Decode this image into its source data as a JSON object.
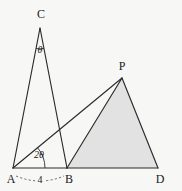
{
  "figure": {
    "type": "geometry-diagram",
    "caption": "",
    "background_color": "#f7f7f5",
    "stroke_color": "#2b2b2b",
    "shaded_fill_color": "#e2e2e2",
    "vertices": [
      {
        "id": "C",
        "label": "C",
        "x": 40,
        "y": 28,
        "label_x": 41,
        "label_y": 14
      },
      {
        "id": "P",
        "label": "P",
        "x": 122,
        "y": 78,
        "label_x": 122,
        "label_y": 66
      },
      {
        "id": "A",
        "label": "A",
        "x": 13,
        "y": 168,
        "label_x": 11,
        "label_y": 179
      },
      {
        "id": "B",
        "label": "B",
        "x": 67,
        "y": 168,
        "label_x": 69,
        "label_y": 179
      },
      {
        "id": "D",
        "label": "D",
        "x": 158,
        "y": 168,
        "label_x": 160,
        "label_y": 179
      }
    ],
    "segments": [
      {
        "id": "AC",
        "from": "A",
        "to": "C"
      },
      {
        "id": "CB",
        "from": "C",
        "to": "B"
      },
      {
        "id": "AB",
        "from": "A",
        "to": "B"
      },
      {
        "id": "AP",
        "from": "A",
        "to": "P"
      },
      {
        "id": "BP",
        "from": "B",
        "to": "P"
      },
      {
        "id": "PD",
        "from": "P",
        "to": "D"
      },
      {
        "id": "BD",
        "from": "B",
        "to": "D"
      }
    ],
    "shaded_regions": [
      {
        "id": "triangle-BPD",
        "vertices": [
          "B",
          "P",
          "D"
        ]
      }
    ],
    "angle_marks": [
      {
        "id": "angle-at-C",
        "label": "θ",
        "vertex": "C",
        "label_x": 40,
        "label_y": 50
      },
      {
        "id": "angle-at-A",
        "label": "2θ",
        "vertex": "A",
        "label_x": 39,
        "label_y": 155
      }
    ],
    "length_marks": [
      {
        "id": "length-AB",
        "label": "4",
        "from": "A",
        "to": "B",
        "label_x": 40,
        "label_y": 180
      }
    ]
  }
}
